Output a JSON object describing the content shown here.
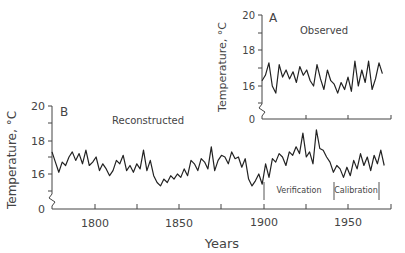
{
  "chart_data": [
    {
      "panel": "B",
      "type": "line",
      "title": "Reconstructed",
      "panel_label": "B",
      "xlabel": "Years",
      "ylabel": "Temperature, °C",
      "xlim": [
        1775,
        1975
      ],
      "ylim_display": [
        15,
        20
      ],
      "y_axis_break": true,
      "y_ticks": [
        0,
        16,
        18,
        20
      ],
      "x_ticks": [
        1800,
        1850,
        1900,
        1950
      ],
      "x_minor_ticks": [
        1825,
        1875,
        1925,
        1975
      ],
      "annotations": [
        {
          "label": "Verification",
          "x_start": 1900,
          "x_end": 1941
        },
        {
          "label": "Calibration",
          "x_start": 1941,
          "x_end": 1970
        }
      ],
      "x": [
        1775,
        1777,
        1779,
        1781,
        1783,
        1785,
        1787,
        1789,
        1791,
        1793,
        1795,
        1797,
        1799,
        1801,
        1803,
        1805,
        1807,
        1809,
        1811,
        1813,
        1815,
        1817,
        1819,
        1821,
        1823,
        1825,
        1827,
        1829,
        1831,
        1833,
        1835,
        1837,
        1839,
        1841,
        1843,
        1845,
        1847,
        1849,
        1851,
        1853,
        1855,
        1857,
        1859,
        1861,
        1863,
        1865,
        1867,
        1869,
        1871,
        1873,
        1875,
        1877,
        1879,
        1881,
        1883,
        1885,
        1887,
        1889,
        1891,
        1893,
        1895,
        1897,
        1899,
        1901,
        1903,
        1905,
        1907,
        1909,
        1911,
        1913,
        1915,
        1917,
        1919,
        1921,
        1923,
        1925,
        1927,
        1929,
        1931,
        1933,
        1935,
        1937,
        1939,
        1941,
        1943,
        1945,
        1947,
        1949,
        1951,
        1953,
        1955,
        1957,
        1959,
        1961,
        1963,
        1965,
        1967,
        1969,
        1971
      ],
      "values": [
        17.3,
        16.7,
        16.1,
        16.7,
        16.5,
        17.0,
        17.3,
        16.8,
        17.2,
        16.6,
        17.4,
        16.5,
        16.7,
        17.0,
        16.2,
        16.6,
        16.3,
        15.9,
        16.2,
        16.8,
        16.6,
        17.1,
        16.2,
        16.5,
        16.1,
        16.6,
        16.3,
        17.4,
        16.2,
        16.8,
        15.9,
        15.5,
        15.3,
        15.7,
        15.5,
        15.9,
        15.7,
        16.0,
        15.8,
        16.3,
        15.9,
        16.8,
        16.6,
        16.2,
        16.9,
        16.7,
        16.3,
        17.6,
        16.2,
        16.8,
        17.1,
        17.0,
        16.6,
        17.3,
        16.9,
        17.0,
        16.4,
        16.9,
        15.7,
        15.3,
        15.6,
        16.0,
        15.4,
        16.6,
        15.8,
        16.9,
        16.7,
        17.2,
        17.0,
        16.5,
        17.3,
        17.1,
        17.6,
        17.2,
        18.4,
        17.0,
        17.3,
        16.6,
        18.6,
        17.5,
        17.4,
        17.0,
        16.7,
        16.1,
        16.5,
        16.3,
        15.8,
        16.4,
        15.9,
        16.8,
        16.3,
        17.2,
        16.5,
        17.0,
        16.2,
        17.1,
        16.6,
        17.4,
        16.5
      ]
    },
    {
      "panel": "A",
      "type": "line",
      "title": "Observed",
      "panel_label": "A",
      "ylabel": "Temperature, °C",
      "xlim": [
        1900,
        1975
      ],
      "y_axis_break": true,
      "y_ticks": [
        0,
        16,
        18,
        20
      ],
      "x": [
        1900,
        1902,
        1904,
        1906,
        1908,
        1910,
        1912,
        1914,
        1916,
        1918,
        1920,
        1922,
        1924,
        1926,
        1928,
        1930,
        1932,
        1934,
        1936,
        1938,
        1940,
        1942,
        1944,
        1946,
        1948,
        1950,
        1952,
        1954,
        1956,
        1958,
        1960,
        1962,
        1964,
        1966,
        1968,
        1970
      ],
      "values": [
        16.3,
        16.6,
        17.3,
        16.0,
        15.6,
        17.2,
        16.5,
        16.9,
        16.4,
        16.8,
        16.2,
        17.1,
        16.6,
        16.9,
        16.3,
        16.0,
        17.2,
        16.4,
        15.8,
        16.9,
        16.3,
        16.1,
        15.6,
        16.2,
        15.8,
        16.5,
        15.7,
        17.4,
        16.0,
        16.9,
        16.2,
        17.4,
        15.8,
        16.4,
        17.3,
        16.7
      ]
    }
  ],
  "panel_b": {
    "label": "B",
    "title": "Reconstructed",
    "ylabel": "Temperature, °C",
    "xlabel": "Years",
    "y_tick_labels": {
      "t20": "20",
      "t18": "18",
      "t16": "16",
      "t0": "0"
    },
    "x_tick_labels": {
      "t1800": "1800",
      "t1850": "1850",
      "t1900": "1900",
      "t1950": "1950"
    },
    "verification_label": "Verification",
    "calibration_label": "Calibration"
  },
  "panel_a": {
    "label": "A",
    "title": "Observed",
    "ylabel": "Temperature, °C",
    "y_tick_labels": {
      "t20": "20",
      "t18": "18",
      "t16": "16",
      "t0": "0"
    }
  },
  "style": {
    "line_color": "#222222",
    "axis_color": "#444444"
  }
}
